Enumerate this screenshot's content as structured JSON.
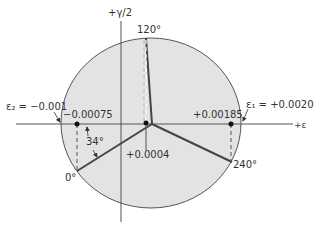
{
  "diagram": {
    "type": "mohr-circle-strain",
    "axes": {
      "x_label": "+ε",
      "y_label": "+γ/2"
    },
    "colors": {
      "circle_fill": "#e3e3e3",
      "circle_stroke": "#555555",
      "line": "#444444",
      "axis": "#555555",
      "text": "#333333"
    },
    "annotations": {
      "eps2": "ε₂ = −0.001",
      "eps1": "ε₁ = +0.0020",
      "left_point": "−0.00075",
      "right_point": "+0.00185",
      "center_point": "+0.0004",
      "angle_label": "34°"
    },
    "gauge_points": [
      {
        "label": "0°"
      },
      {
        "label": "120°"
      },
      {
        "label": "240°"
      }
    ]
  }
}
